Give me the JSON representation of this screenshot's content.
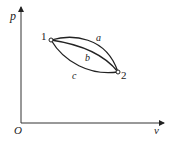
{
  "diagram": {
    "type": "p-v diagram",
    "axes": {
      "y_label": "p",
      "x_label": "v",
      "origin_label": "O"
    },
    "states": [
      {
        "label": "1",
        "x": 51,
        "y": 40
      },
      {
        "label": "2",
        "x": 118,
        "y": 72
      }
    ],
    "paths": [
      {
        "label": "a",
        "description": "upper curve from 1 to 2"
      },
      {
        "label": "b",
        "description": "middle curve from 1 to 2"
      },
      {
        "label": "c",
        "description": "lower curve from 1 to 2"
      }
    ],
    "colors": {
      "line": "#222222",
      "background": "#ffffff"
    }
  }
}
